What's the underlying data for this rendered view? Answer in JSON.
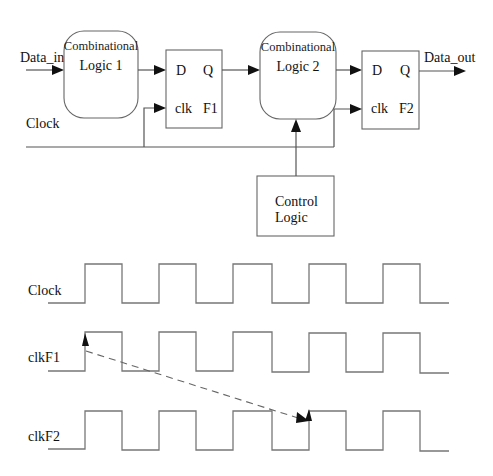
{
  "circuit": {
    "input_label": "Data_in",
    "output_label": "Data_out",
    "clock_label": "Clock",
    "comb_logic_1": {
      "line1": "Combinational",
      "line2": "Logic 1"
    },
    "comb_logic_2": {
      "line1": "Combinational",
      "line2": "Logic 2"
    },
    "flipflop_1": {
      "d": "D",
      "q": "Q",
      "clk": "clk",
      "name": "F1"
    },
    "flipflop_2": {
      "d": "D",
      "q": "Q",
      "clk": "clk",
      "name": "F2"
    },
    "control_logic": {
      "line1": "Control",
      "line2": "Logic"
    }
  },
  "timing": {
    "signals": [
      {
        "label": "Clock",
        "rising_edges": [
          85,
          159,
          233,
          309,
          383
        ]
      },
      {
        "label": "clkF1",
        "rising_edges": [
          85,
          159,
          233,
          309,
          383
        ]
      },
      {
        "label": "clkF2",
        "rising_edges": [
          85,
          159,
          233,
          309,
          383
        ]
      }
    ],
    "skew_arrow": {
      "from": "clkF1 rising edge 1",
      "to": "clkF2 rising edge 4",
      "style": "dashed"
    }
  }
}
